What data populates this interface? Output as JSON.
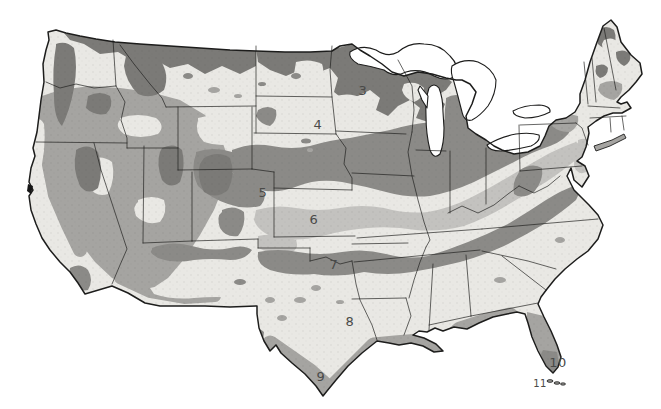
{
  "map": {
    "zone_labels": [
      {
        "label": "3",
        "x": 363,
        "y": 95,
        "size": 13
      },
      {
        "label": "4",
        "x": 318,
        "y": 129,
        "size": 13
      },
      {
        "label": "5",
        "x": 263,
        "y": 197,
        "size": 13
      },
      {
        "label": "6",
        "x": 314,
        "y": 224,
        "size": 13
      },
      {
        "label": "7",
        "x": 334,
        "y": 269,
        "size": 13
      },
      {
        "label": "8",
        "x": 350,
        "y": 326,
        "size": 13
      },
      {
        "label": "9",
        "x": 321,
        "y": 381,
        "size": 13
      },
      {
        "label": "10",
        "x": 558,
        "y": 367,
        "size": 13
      },
      {
        "label": "11",
        "x": 540,
        "y": 387,
        "size": 10
      }
    ],
    "palette": {
      "background": "#ffffff",
      "zone_light": "#e9e8e4",
      "zone_medium_light": "#c3c2bf",
      "zone_medium": "#a5a4a1",
      "zone_dark_soft": "#8b8a87",
      "zone_dark": "#7b7a77",
      "outline": "#1d1d1c",
      "label_color": "#4a4a48"
    }
  }
}
